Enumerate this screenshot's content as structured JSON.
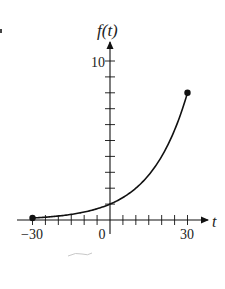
{
  "chart_data": {
    "type": "line",
    "title": "",
    "xlabel": "t",
    "ylabel": "f(t)",
    "xlim": [
      -30,
      30
    ],
    "ylim": [
      0,
      10
    ],
    "x_tick_step": 5,
    "y_tick_step": 1,
    "x_tick_labels": [
      {
        "value": -30,
        "label": "−30"
      },
      {
        "value": 0,
        "label": "0"
      },
      {
        "value": 30,
        "label": "30"
      }
    ],
    "y_tick_labels": [
      {
        "value": 10,
        "label": "10"
      }
    ],
    "grid": false,
    "legend": null,
    "series": [
      {
        "name": "f(t)",
        "description": "exponential growth, f(t) = 2^(t/10)",
        "x": [
          -30,
          -25,
          -20,
          -15,
          -10,
          -5,
          0,
          5,
          10,
          15,
          20,
          25,
          30
        ],
        "values": [
          0.125,
          0.177,
          0.25,
          0.354,
          0.5,
          0.707,
          1,
          1.414,
          2,
          2.828,
          4,
          5.657,
          8
        ]
      }
    ],
    "endpoints": [
      {
        "x": -30,
        "y": 0.125,
        "style": "closed-dot"
      },
      {
        "x": 30,
        "y": 8,
        "style": "closed-dot"
      }
    ],
    "colors": {
      "curve": "#111111",
      "axes": "#111111",
      "text": "#222222"
    }
  }
}
